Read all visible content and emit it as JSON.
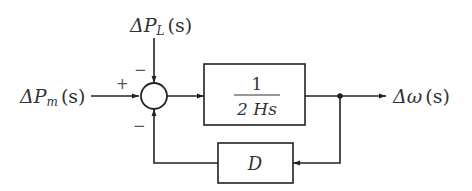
{
  "diagram": {
    "type": "block-diagram",
    "inputs": {
      "mechanical_power": {
        "delta": "Δ",
        "symbol": "P",
        "subscript": "m",
        "arg": "(s)",
        "sign": "+"
      },
      "load_power": {
        "delta": "Δ",
        "symbol": "P",
        "subscript": "L",
        "arg": "(s)",
        "sign": "−"
      }
    },
    "summing_junction": {
      "feedback_sign": "−"
    },
    "forward_block": {
      "numerator": "1",
      "denominator": "2 Hs"
    },
    "feedback_block": {
      "label": "D"
    },
    "output": {
      "delta": "Δ",
      "symbol": "ω",
      "arg": "(s)"
    },
    "colors": {
      "line": "#222222",
      "text": "#333333",
      "background": "#ffffff"
    }
  }
}
